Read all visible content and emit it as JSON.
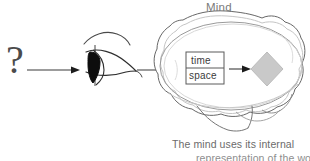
{
  "figure": {
    "title_label": "Mind",
    "stimulus_symbol": "?",
    "caption": {
      "line1": "The mind uses its internal",
      "line2": "representation of the world"
    },
    "inner_box": {
      "row_1": "time",
      "row_2": "space"
    },
    "icons": {
      "eye": "eye-icon",
      "brain": "brain-icon",
      "diamond": "diamond-icon",
      "arrow_1": "arrow-right-icon",
      "arrow_2": "arrow-right-icon",
      "arrow_3": "arrow-right-icon"
    },
    "colors": {
      "background": "#ffffff",
      "ink": "#3b3b3b",
      "brain_outline": "#6b6b6b",
      "brain_inner": "#bdbdbd",
      "diamond_fill": "#c9c9c9",
      "diamond_stroke": "#bcbcbc",
      "label_gray": "#7a7a7a",
      "caption_gray": "#6b6b6b",
      "pupil": "#111111"
    }
  }
}
